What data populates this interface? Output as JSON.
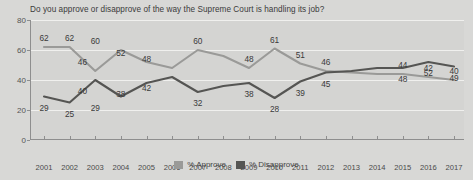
{
  "chart_data": {
    "type": "line",
    "title": "Do you approve or disapprove of the way the Supreme Court is handling its job?",
    "xlabel": "",
    "ylabel": "",
    "ylim": [
      0,
      80
    ],
    "yticks": [
      0,
      20,
      40,
      60,
      80
    ],
    "grid": true,
    "legend_position": "bottom-center",
    "x": [
      2001,
      2002,
      2003,
      2004,
      2005,
      2006,
      2007,
      2008,
      2009,
      2010,
      2011,
      2012,
      2013,
      2014,
      2015,
      2016,
      2017
    ],
    "categories": [
      "2001",
      "2002",
      "2003",
      "2004",
      "2005",
      "2006",
      "2007",
      "2008",
      "2009",
      "2010",
      "2011",
      "2012",
      "2013",
      "2014",
      "2015",
      "2016",
      "2017"
    ],
    "series": [
      {
        "name": "% Approve",
        "color": "#9a9a98",
        "values": [
          62,
          62,
          46,
          60,
          52,
          48,
          60,
          56,
          48,
          61,
          51,
          46,
          45,
          44,
          44,
          42,
          40
        ],
        "labels": [
          {
            "x": 2001,
            "y": 62,
            "text": "62"
          },
          {
            "x": 2002,
            "y": 62,
            "text": "62"
          },
          {
            "x": 2002.5,
            "y": 46,
            "text": "46"
          },
          {
            "x": 2003,
            "y": 60,
            "text": "60"
          },
          {
            "x": 2004,
            "y": 52,
            "text": "52"
          },
          {
            "x": 2005,
            "y": 48,
            "text": "48"
          },
          {
            "x": 2007,
            "y": 60,
            "text": "60"
          },
          {
            "x": 2009,
            "y": 48,
            "text": "48"
          },
          {
            "x": 2010,
            "y": 61,
            "text": "61"
          },
          {
            "x": 2011,
            "y": 51,
            "text": "51"
          },
          {
            "x": 2012,
            "y": 46,
            "text": "46"
          },
          {
            "x": 2015,
            "y": 44,
            "text": "44"
          },
          {
            "x": 2016,
            "y": 42,
            "text": "42"
          },
          {
            "x": 2017,
            "y": 40,
            "text": "40"
          }
        ]
      },
      {
        "name": "% Disapprove",
        "color": "#555553",
        "values": [
          29,
          25,
          40,
          29,
          38,
          42,
          32,
          36,
          38,
          28,
          39,
          45,
          46,
          48,
          48,
          52,
          49
        ],
        "labels": [
          {
            "x": 2001,
            "y": 29,
            "text": "29"
          },
          {
            "x": 2002,
            "y": 25,
            "text": "25"
          },
          {
            "x": 2002.5,
            "y": 40,
            "text": "40"
          },
          {
            "x": 2003,
            "y": 29,
            "text": "29"
          },
          {
            "x": 2004,
            "y": 38,
            "text": "38"
          },
          {
            "x": 2005,
            "y": 42,
            "text": "42"
          },
          {
            "x": 2007,
            "y": 32,
            "text": "32"
          },
          {
            "x": 2009,
            "y": 38,
            "text": "38"
          },
          {
            "x": 2010,
            "y": 28,
            "text": "28"
          },
          {
            "x": 2011,
            "y": 39,
            "text": "39"
          },
          {
            "x": 2012,
            "y": 45,
            "text": "45"
          },
          {
            "x": 2015,
            "y": 48,
            "text": "48"
          },
          {
            "x": 2016,
            "y": 52,
            "text": "52"
          },
          {
            "x": 2017,
            "y": 49,
            "text": "49"
          }
        ]
      }
    ]
  }
}
